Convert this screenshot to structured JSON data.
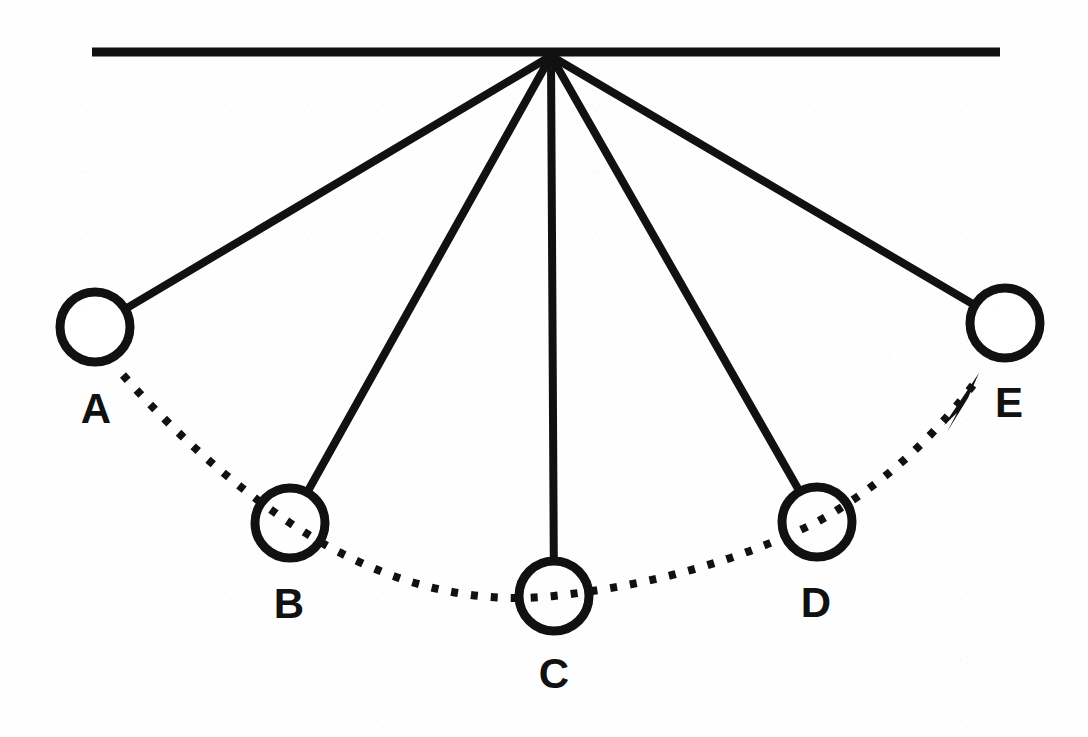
{
  "figure": {
    "kind": "physics-diagram",
    "background_color": "#ffffff",
    "ink_color": "#111111",
    "width": 1088,
    "height": 737
  },
  "support": {
    "name": "ceiling",
    "x1": 92,
    "y1": 52,
    "x2": 1000,
    "y2": 52,
    "thickness": 9
  },
  "pivot": {
    "x": 551,
    "y": 56,
    "label": ""
  },
  "bobs": [
    {
      "id": "A",
      "label": "A",
      "cx": 95,
      "cy": 327,
      "r": 35,
      "stroke": 9,
      "label_x": 96,
      "label_y": 388
    },
    {
      "id": "B",
      "label": "B",
      "cx": 290,
      "cy": 523,
      "r": 35,
      "stroke": 9,
      "label_x": 289,
      "label_y": 583
    },
    {
      "id": "C",
      "label": "C",
      "cx": 554,
      "cy": 596,
      "r": 35,
      "stroke": 9,
      "label_x": 554,
      "label_y": 653
    },
    {
      "id": "D",
      "label": "D",
      "cx": 817,
      "cy": 522,
      "r": 35,
      "stroke": 9,
      "label_x": 816,
      "label_y": 582
    },
    {
      "id": "E",
      "label": "E",
      "cx": 1005,
      "cy": 323,
      "r": 35,
      "stroke": 9,
      "label_x": 1009,
      "label_y": 382
    }
  ],
  "strings": [
    {
      "from": "pivot",
      "to": "A",
      "stroke": 8
    },
    {
      "from": "pivot",
      "to": "B",
      "stroke": 8
    },
    {
      "from": "pivot",
      "to": "C",
      "stroke": 8
    },
    {
      "from": "pivot",
      "to": "D",
      "stroke": 8
    },
    {
      "from": "pivot",
      "to": "E",
      "stroke": 8
    }
  ],
  "trajectory": {
    "name": "swing-path",
    "style": "dashed",
    "stroke": 8,
    "dash": "7 13",
    "path": "M 123 375 Q 200 462 290 523 Q 420 610 554 596 Q 700 580 817 522 Q 910 470 976 381",
    "arrow": {
      "direction": "toward-E",
      "tip_x": 978,
      "tip_y": 377,
      "points": "978,375 945,424 956,414 948,430"
    }
  },
  "caption": ""
}
